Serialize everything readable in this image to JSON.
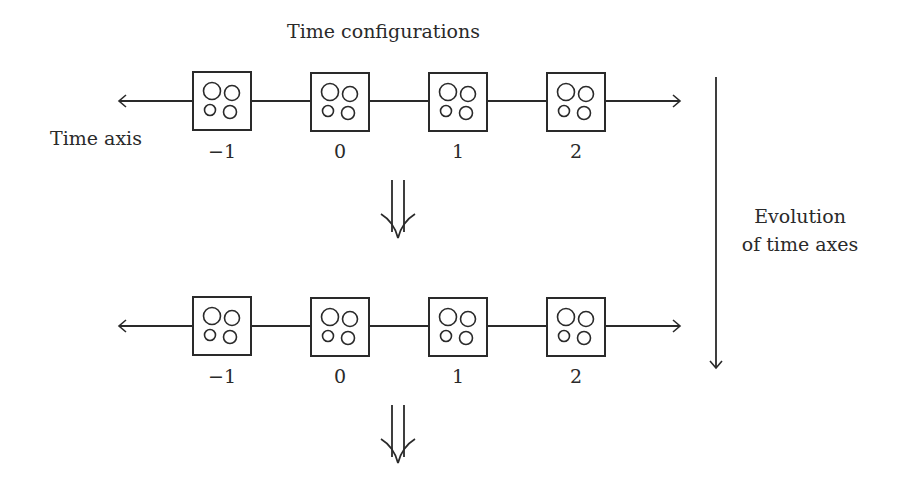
{
  "title": "Time configurations",
  "time_axis_label": "Time axis",
  "evolution_label": {
    "line1": "Evolution",
    "line2": "of time axes"
  },
  "rows": [
    {
      "ticks": [
        "−1",
        "0",
        "1",
        "2"
      ]
    },
    {
      "ticks": [
        "−1",
        "0",
        "1",
        "2"
      ]
    }
  ],
  "icons": {
    "configuration_box": "square-with-four-circles",
    "transition_arrow": "double-down-arrow",
    "evolution_arrow": "long-down-arrow"
  },
  "colors": {
    "stroke": "#2a2a2a",
    "background": "#ffffff"
  }
}
